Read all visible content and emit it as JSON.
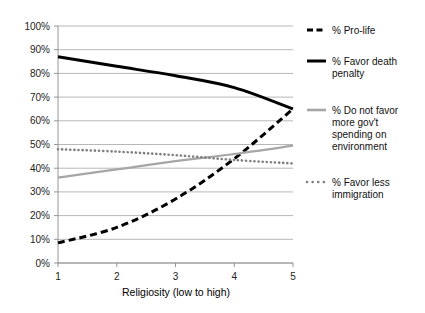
{
  "chart_data": {
    "type": "line",
    "title": "",
    "xlabel": "Religiosity (low to high)",
    "ylabel": "",
    "x": [
      1,
      2,
      3,
      4,
      5
    ],
    "xticklabels": [
      "1",
      "2",
      "3",
      "4",
      "5"
    ],
    "yticklabels": [
      "0%",
      "10%",
      "20%",
      "30%",
      "40%",
      "50%",
      "60%",
      "70%",
      "80%",
      "90%",
      "100%"
    ],
    "ylim": [
      0,
      100
    ],
    "xlim": [
      1,
      5
    ],
    "grid": "horizontal",
    "legend_position": "right",
    "series": [
      {
        "name": "% Pro-life",
        "values": [
          8.5,
          15,
          27,
          44,
          65
        ],
        "color": "#000000",
        "style": "dashed"
      },
      {
        "name": "% Favor death penalty",
        "values": [
          87,
          83,
          79,
          74,
          65
        ],
        "color": "#000000",
        "style": "solid"
      },
      {
        "name": "% Do not favor more gov't spending on environment",
        "values": [
          36,
          39.5,
          43,
          46,
          49.5
        ],
        "color": "#a6a6a6",
        "style": "solid"
      },
      {
        "name": "% Favor less immigration",
        "values": [
          48,
          47,
          45.5,
          43.5,
          42
        ],
        "color": "#808080",
        "style": "dotted"
      }
    ]
  },
  "legend": {
    "entries": [
      {
        "label_line1": "% Pro-life",
        "label_line2": "",
        "label_line3": "",
        "label_line4": ""
      },
      {
        "label_line1": "% Favor death",
        "label_line2": "penalty",
        "label_line3": "",
        "label_line4": ""
      },
      {
        "label_line1": "% Do not favor",
        "label_line2": "more gov't",
        "label_line3": "spending on",
        "label_line4": "environment"
      },
      {
        "label_line1": "% Favor less",
        "label_line2": "immigration",
        "label_line3": "",
        "label_line4": ""
      }
    ]
  },
  "axis": {
    "x_title": "Religiosity (low to high)"
  }
}
